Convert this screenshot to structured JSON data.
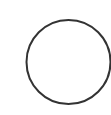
{
  "canvas": {
    "width": 111,
    "height": 115,
    "background": "#ffffff"
  },
  "shape": {
    "type": "circle-outline",
    "icon": "circle-icon",
    "cx": 68.5,
    "cy": 62,
    "r": 42,
    "stroke": "#333333",
    "stroke_width": 2,
    "fill": "none"
  }
}
